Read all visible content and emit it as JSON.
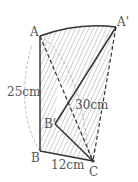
{
  "figure": {
    "points": {
      "A": "A",
      "A_prime": "A'",
      "B": "B",
      "B_prime": "B'",
      "C": "C"
    },
    "lengths": {
      "AB": "25cm",
      "AC": "30cm",
      "BC": "12cm"
    },
    "colors": {
      "line": "#333333",
      "hatch": "#888888",
      "dashed_arc": "#aaaaaa"
    }
  }
}
